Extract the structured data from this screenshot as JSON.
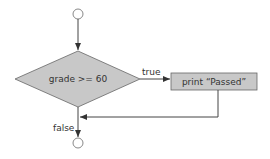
{
  "diagram": {
    "type": "flowchart",
    "decision": {
      "label": "grade >= 60",
      "fill": "#c8c8c8"
    },
    "action": {
      "label": "print “Passed”",
      "fill": "#c8c8c8"
    },
    "edges": {
      "true_label": "true",
      "false_label": "false"
    },
    "nodes": [
      "start",
      "decision",
      "action",
      "end"
    ],
    "colors": {
      "stroke": "#555555",
      "node_fill": "#c8c8c8",
      "line": "#444444"
    }
  }
}
